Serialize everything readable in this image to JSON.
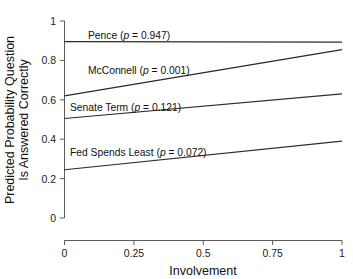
{
  "chart_data": {
    "type": "line",
    "title": "",
    "subtitle": "",
    "xlabel": "Involvement",
    "ylabel": "Predicted Probability Question Is Answered Correctly",
    "ylabel_line1": "Predicted Probability Question",
    "ylabel_line2": "Is Answered Correctly",
    "xlim": [
      0,
      1
    ],
    "ylim": [
      0,
      1
    ],
    "x": [
      0,
      1
    ],
    "xticks": [
      0,
      0.25,
      0.5,
      0.75,
      1
    ],
    "xticklabels": [
      "0",
      "0.25",
      "0.5",
      "0.75",
      "1"
    ],
    "yticks": [
      0,
      0.2,
      0.4,
      0.6,
      0.8,
      1
    ],
    "yticklabels": [
      "0",
      "0.2",
      "0.4",
      "0.6",
      "0.8",
      "1"
    ],
    "grid": false,
    "legend_position": "inline-annotations",
    "series": [
      {
        "name": "Pence",
        "p_value": "0.947",
        "label": "Pence (p = 0.947)",
        "label_prefix": "Pence (",
        "label_p": "p",
        "label_suffix": " = 0.947)",
        "values": [
          0.895,
          0.893
        ],
        "color": "#2b2b2b"
      },
      {
        "name": "McConnell",
        "p_value": "0.001",
        "label": "McConnell (p = 0.001)",
        "label_prefix": "McConnell (",
        "label_p": "p",
        "label_suffix": " = 0.001)",
        "values": [
          0.62,
          0.855
        ],
        "color": "#2b2b2b"
      },
      {
        "name": "Senate Term",
        "p_value": "0.121",
        "label": "Senate Term (p = 0.121)",
        "label_prefix": "Senate Term (",
        "label_p": "p",
        "label_suffix": " = 0.121)",
        "values": [
          0.505,
          0.63
        ],
        "color": "#2b2b2b"
      },
      {
        "name": "Fed Spends Least",
        "p_value": "0.072",
        "label": "Fed Spends Least (p = 0.072)",
        "label_prefix": "Fed Spends Least (",
        "label_p": "p",
        "label_suffix": " = 0.072)",
        "values": [
          0.245,
          0.39
        ],
        "color": "#2b2b2b"
      }
    ],
    "annotations": [
      {
        "text": "Pence (p = 0.947)",
        "x": 0.085,
        "y": 0.935
      },
      {
        "text": "McConnell (p = 0.001)",
        "x": 0.085,
        "y": 0.755
      },
      {
        "text": "Senate Term (p = 0.121)",
        "x": 0.055,
        "y": 0.565
      },
      {
        "text": "Fed Spends Least (p = 0.072)",
        "x": 0.055,
        "y": 0.345
      }
    ]
  },
  "axes": {
    "x_title": "Involvement",
    "y_title_line1": "Predicted Probability Question",
    "y_title_line2": "Is Answered Correctly"
  }
}
